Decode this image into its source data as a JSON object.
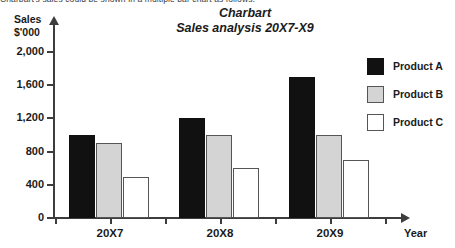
{
  "top_caption": "Charbart's sales could be shown in a multiple bar chart as follows:",
  "y_axis_caption_line1": "Sales",
  "y_axis_caption_line2": "$'000",
  "x_axis_caption": "Year",
  "legend": {
    "items": [
      {
        "label": "Product A",
        "swatch": "black-square-swatch",
        "color": "#111111"
      },
      {
        "label": "Product B",
        "swatch": "gray-square-swatch",
        "color": "#d4d4d4"
      },
      {
        "label": "Product C",
        "swatch": "white-square-swatch",
        "color": "#ffffff"
      }
    ]
  },
  "chart_data": {
    "type": "bar",
    "title": "Charbart",
    "subtitle": "Sales analysis 20X7-X9",
    "xlabel": "Year",
    "ylabel": "Sales $'000",
    "categories": [
      "20X7",
      "20X8",
      "20X9"
    ],
    "series": [
      {
        "name": "Product A",
        "color": "#111111",
        "values": [
          1000,
          1200,
          1700
        ]
      },
      {
        "name": "Product B",
        "color": "#d4d4d4",
        "values": [
          900,
          1000,
          1000
        ]
      },
      {
        "name": "Product C",
        "color": "#ffffff",
        "values": [
          500,
          600,
          700
        ]
      }
    ],
    "ylim": [
      0,
      2000
    ],
    "yticks": [
      0,
      400,
      800,
      1200,
      1600,
      2000
    ],
    "ytick_labels": [
      "0",
      "400",
      "800",
      "1,200",
      "1,600",
      "2,000"
    ],
    "grid": false,
    "legend_position": "right"
  }
}
